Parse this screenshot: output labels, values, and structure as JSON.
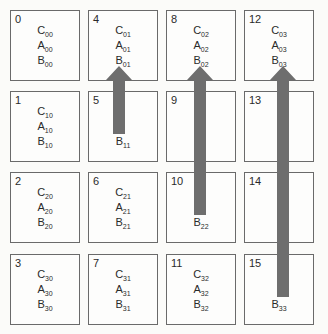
{
  "diagram": {
    "type": "block-matrix-shift",
    "colors": {
      "arrow": "#6e6e6e",
      "border": "#6a6a6a"
    },
    "cells": [
      {
        "id": "0",
        "col": 0,
        "row": 0,
        "lines": [
          [
            "C",
            "00"
          ],
          [
            "A",
            "00"
          ],
          [
            "B",
            "00"
          ]
        ]
      },
      {
        "id": "1",
        "col": 0,
        "row": 1,
        "lines": [
          [
            "C",
            "10"
          ],
          [
            "A",
            "10"
          ],
          [
            "B",
            "10"
          ]
        ]
      },
      {
        "id": "2",
        "col": 0,
        "row": 2,
        "lines": [
          [
            "C",
            "20"
          ],
          [
            "A",
            "20"
          ],
          [
            "B",
            "20"
          ]
        ]
      },
      {
        "id": "3",
        "col": 0,
        "row": 3,
        "lines": [
          [
            "C",
            "30"
          ],
          [
            "A",
            "30"
          ],
          [
            "B",
            "30"
          ]
        ]
      },
      {
        "id": "4",
        "col": 1,
        "row": 0,
        "lines": [
          [
            "C",
            "01"
          ],
          [
            "A",
            "01"
          ],
          [
            "B",
            "01"
          ]
        ]
      },
      {
        "id": "5",
        "col": 1,
        "row": 1,
        "lines": [
          [
            "",
            ""
          ],
          [
            "",
            ""
          ],
          [
            "B",
            "11"
          ]
        ]
      },
      {
        "id": "6",
        "col": 1,
        "row": 2,
        "lines": [
          [
            "C",
            "21"
          ],
          [
            "A",
            "21"
          ],
          [
            "B",
            "21"
          ]
        ]
      },
      {
        "id": "7",
        "col": 1,
        "row": 3,
        "lines": [
          [
            "C",
            "31"
          ],
          [
            "A",
            "31"
          ],
          [
            "B",
            "31"
          ]
        ]
      },
      {
        "id": "8",
        "col": 2,
        "row": 0,
        "lines": [
          [
            "C",
            "02"
          ],
          [
            "A",
            "02"
          ],
          [
            "B",
            "02"
          ]
        ]
      },
      {
        "id": "9",
        "col": 2,
        "row": 1,
        "lines": [
          [
            "",
            ""
          ],
          [
            "",
            ""
          ],
          [
            "",
            ""
          ]
        ]
      },
      {
        "id": "10",
        "col": 2,
        "row": 2,
        "lines": [
          [
            "",
            ""
          ],
          [
            "",
            ""
          ],
          [
            "B",
            "22"
          ]
        ]
      },
      {
        "id": "11",
        "col": 2,
        "row": 3,
        "lines": [
          [
            "C",
            "32"
          ],
          [
            "A",
            "32"
          ],
          [
            "B",
            "32"
          ]
        ]
      },
      {
        "id": "12",
        "col": 3,
        "row": 0,
        "lines": [
          [
            "C",
            "03"
          ],
          [
            "A",
            "03"
          ],
          [
            "B",
            "03"
          ]
        ]
      },
      {
        "id": "13",
        "col": 3,
        "row": 1,
        "lines": [
          [
            "",
            ""
          ],
          [
            "",
            ""
          ],
          [
            "",
            ""
          ]
        ]
      },
      {
        "id": "14",
        "col": 3,
        "row": 2,
        "lines": [
          [
            "",
            ""
          ],
          [
            "",
            ""
          ],
          [
            "",
            ""
          ]
        ]
      },
      {
        "id": "15",
        "col": 3,
        "row": 3,
        "lines": [
          [
            "",
            ""
          ],
          [
            "",
            ""
          ],
          [
            "B",
            "33"
          ]
        ]
      }
    ],
    "arrows": [
      {
        "from": "B11",
        "to": "B01",
        "col": 1
      },
      {
        "from": "B22",
        "to": "B02",
        "col": 2
      },
      {
        "from": "B33",
        "to": "B03",
        "col": 3
      }
    ]
  }
}
